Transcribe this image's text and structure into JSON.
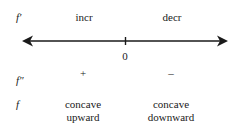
{
  "rows": {
    "fprime": {
      "label": "f′",
      "left": "incr",
      "right": "decr"
    },
    "fdoubleprime": {
      "label": "f″",
      "left": "+",
      "right": "–"
    },
    "f": {
      "label": "f",
      "left_line1": "concave",
      "left_line2": "upward",
      "right_line1": "concave",
      "right_line2": "downward"
    }
  },
  "number_line": {
    "tick_label": "0"
  },
  "colors": {
    "ink": "#1a1a1a"
  }
}
